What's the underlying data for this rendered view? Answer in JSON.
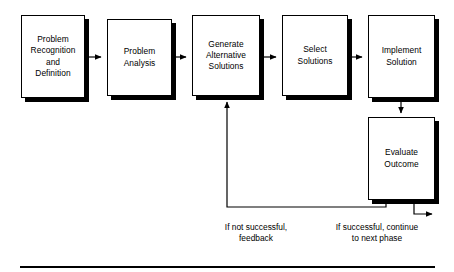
{
  "diagram": {
    "style": {
      "line_color": "#000000",
      "box_fill": "#ffffff",
      "shadow_color": "#000000",
      "text_color": "#000000"
    },
    "nodes": [
      {
        "id": "problem-recognition-and-definition",
        "label": "Problem\nRecognition\nand\nDefinition",
        "x": 21,
        "y": 15,
        "w": 64,
        "h": 83
      },
      {
        "id": "problem-analysis",
        "label": "Problem\nAnalysis",
        "x": 107,
        "y": 19,
        "w": 65,
        "h": 77
      },
      {
        "id": "generate-alternative-solutions",
        "label": "Generate\nAlternative\nSolutions",
        "x": 192,
        "y": 15,
        "w": 68,
        "h": 81
      },
      {
        "id": "select-solutions",
        "label": "Select\nSolutions",
        "x": 282,
        "y": 15,
        "w": 66,
        "h": 81
      },
      {
        "id": "implement-solution",
        "label": "Implement\nSolution",
        "x": 368,
        "y": 15,
        "w": 67,
        "h": 83
      },
      {
        "id": "evaluate-outcome",
        "label": "Evaluate\nOutcome",
        "x": 368,
        "y": 117,
        "w": 67,
        "h": 83
      }
    ],
    "edge_labels": [
      {
        "id": "not-successful-feedback",
        "text": "If not successful,\nfeedback",
        "x": 193,
        "y": 222,
        "w": 126
      },
      {
        "id": "successful-continue",
        "text": "If successful, continue\nto next phase",
        "x": 312,
        "y": 222,
        "w": 130
      }
    ],
    "bottom_rule": {
      "x": 20,
      "y": 266,
      "w": 415,
      "h": 2
    }
  }
}
